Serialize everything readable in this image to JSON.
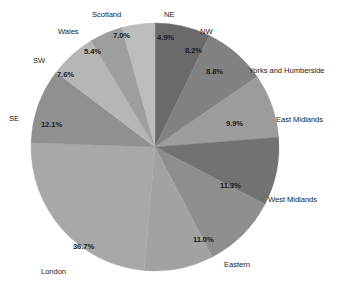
{
  "chart_data": {
    "type": "pie",
    "title": "",
    "subtitle": "",
    "xlabel": "",
    "ylabel": "",
    "legend_position": "none",
    "grid": false,
    "start_angle_deg": 0,
    "direction": "clockwise",
    "categories": [
      "NE",
      "NW",
      "Yorks and Humberside",
      "East Midlands",
      "West Midlands",
      "Eastern",
      "London",
      "SE",
      "SW",
      "Wales",
      "Scotland"
    ],
    "values": [
      4.9,
      8.2,
      8.8,
      9.9,
      11.3,
      11.0,
      36.7,
      12.1,
      7.6,
      5.4,
      7.0
    ],
    "value_labels": [
      "4.9%",
      "8.2%",
      "8.8%",
      "9.9%",
      "11.3%",
      "11.0%",
      "36.7%",
      "12.1%",
      "7.6%",
      "5.4%",
      "7.0%"
    ],
    "slice_colors": [
      "#6a6a6a",
      "#828282",
      "#9c9c9c",
      "#727272",
      "#8e8e8e",
      "#a2a2a2",
      "#a8a8a8",
      "#909090",
      "#b6b6b6",
      "#9e9e9e",
      "#bcbcbc"
    ],
    "slice_angles_deg": [
      26.0,
      29.5,
      30.0,
      32.0,
      35.0,
      32.5,
      87.0,
      35.0,
      22.0,
      15.5,
      15.5
    ],
    "slices": [
      {
        "label": "NE",
        "value": 4.9,
        "value_label": "4.9%",
        "color": "#6a6a6a"
      },
      {
        "label": "NW",
        "value": 8.2,
        "value_label": "8.2%",
        "color": "#828282"
      },
      {
        "label": "Yorks and Humberside",
        "value": 8.8,
        "value_label": "8.8%",
        "color": "#9c9c9c"
      },
      {
        "label": "East Midlands",
        "value": 9.9,
        "value_label": "9.9%",
        "color": "#727272"
      },
      {
        "label": "West Midlands",
        "value": 11.3,
        "value_label": "11.3%",
        "color": "#8e8e8e"
      },
      {
        "label": "Eastern",
        "value": 11.0,
        "value_label": "11.0%",
        "color": "#a2a2a2"
      },
      {
        "label": "London",
        "value": 36.7,
        "value_label": "36.7%",
        "color": "#a8a8a8"
      },
      {
        "label": "SE",
        "value": 12.1,
        "value_label": "12.1%",
        "color": "#909090"
      },
      {
        "label": "SW",
        "value": 7.6,
        "value_label": "7.6%",
        "color": "#b6b6b6"
      },
      {
        "label": "Wales",
        "value": 5.4,
        "value_label": "5.4%",
        "color": "#9e9e9e"
      },
      {
        "label": "Scotland",
        "value": 7.0,
        "value_label": "7.0%",
        "color": "#bcbcbc"
      }
    ]
  },
  "geometry": {
    "center_x": 155,
    "center_y": 147,
    "radius": 124
  },
  "label_positions": {
    "pct": [
      {
        "x": 157,
        "y": 34
      },
      {
        "x": 185,
        "y": 47
      },
      {
        "x": 206,
        "y": 68
      },
      {
        "x": 226,
        "y": 120
      },
      {
        "x": 220,
        "y": 182
      },
      {
        "x": 193,
        "y": 236
      },
      {
        "x": 73,
        "y": 243
      },
      {
        "x": 41,
        "y": 121
      },
      {
        "x": 57,
        "y": 71
      },
      {
        "x": 84,
        "y": 48
      },
      {
        "x": 113,
        "y": 32
      }
    ],
    "cat": [
      {
        "x": 164,
        "y": 11
      },
      {
        "x": 200,
        "y": 28
      },
      {
        "x": 249,
        "y": 67
      },
      {
        "x": 276,
        "y": 116
      },
      {
        "x": 268,
        "y": 196
      },
      {
        "x": 224,
        "y": 261
      },
      {
        "x": 41,
        "y": 268
      },
      {
        "x": 9,
        "y": 115
      },
      {
        "x": 33,
        "y": 57
      },
      {
        "x": 58,
        "y": 28
      },
      {
        "x": 92,
        "y": 11
      }
    ]
  }
}
